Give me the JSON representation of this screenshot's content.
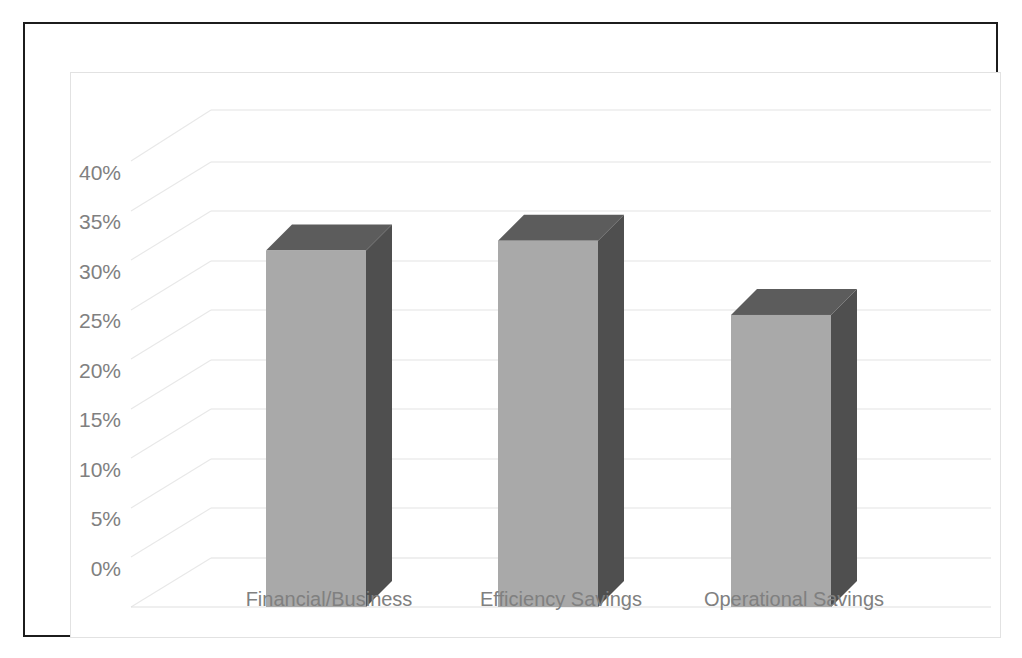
{
  "chart_data": {
    "type": "bar",
    "title": "",
    "subtitle": "",
    "xlabel": "",
    "ylabel": "",
    "categories": [
      "Financial/Business",
      "Efficiency Savings",
      "Operational Savings"
    ],
    "values": [
      36,
      37,
      29.5
    ],
    "value_labels": [
      "36%",
      "37%",
      "29.5%"
    ],
    "ylim": [
      0,
      40
    ],
    "ytick_values": [
      0,
      5,
      10,
      15,
      20,
      25,
      30,
      35,
      40
    ],
    "ytick_labels": [
      "0%",
      "5%",
      "10%",
      "15%",
      "20%",
      "25%",
      "30%",
      "35%",
      "40%"
    ],
    "grid": true,
    "legend": false,
    "legend_position": "none",
    "style": "3d-column",
    "colors": {
      "bar_front": "#a9a9a9",
      "bar_top": "#5c5c5c",
      "bar_side": "#4f4f4f",
      "gridline": "#e4e4e4",
      "tick_text": "#808080",
      "category_text": "#808080",
      "outer_border": "#1c1c1c",
      "inner_border": "#e2e2e2",
      "background": "#ffffff"
    }
  },
  "frame": {
    "outer_border_label": "chart-outer-border",
    "inner_border_label": "chart-plot-border"
  }
}
